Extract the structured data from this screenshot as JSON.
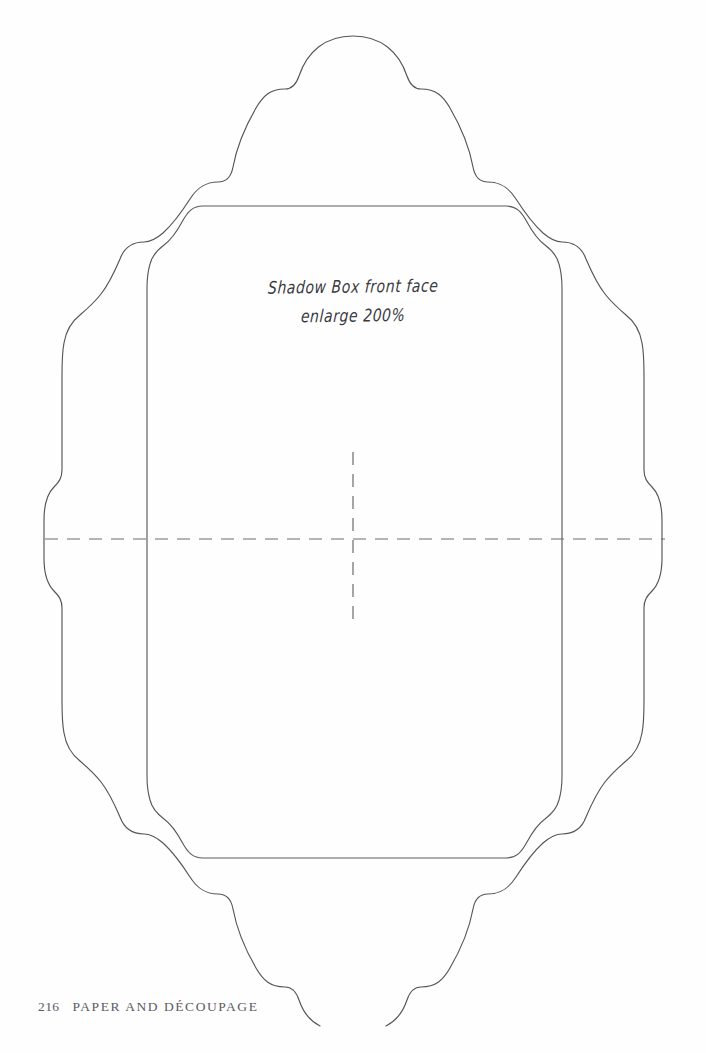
{
  "page": {
    "background_color": "#fefefe",
    "line_color": "#555558",
    "fold_line_color": "#6a6a70"
  },
  "annotation": {
    "line_1": "Shadow Box front face",
    "line_2": "enlarge 200%",
    "enlarge_percent": "200%"
  },
  "footer": {
    "page_number": "216",
    "section_title": "PAPER AND DÉCOUPAGE"
  },
  "template": {
    "name": "shadow-box-front-face-cutting-template",
    "outer_shape_label": "scalloped outer cut line",
    "inner_shape_label": "ogee inner fold rectangle",
    "fold_lines_label": "dashed centre fold lines"
  }
}
